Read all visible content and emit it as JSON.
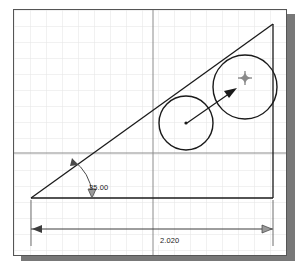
{
  "app": {
    "type": "cad-sketch-canvas",
    "background_color": "#ffffff",
    "border_color": "#555555",
    "shadow_color": "#787878"
  },
  "grid": {
    "minor_spacing_px": 16,
    "minor_color": "#e2e2e2",
    "major_color": "#8c8c8c",
    "major_vertical_x": 139,
    "major_horizontal_y": 143,
    "visible": true
  },
  "geometry": {
    "line_color": "#1a1a1a",
    "triangle": {
      "name": "right-triangle",
      "vertices": [
        [
          17,
          188
        ],
        [
          259,
          188
        ],
        [
          259,
          14
        ]
      ]
    },
    "circles": [
      {
        "name": "left-circle",
        "cx": 172,
        "cy": 113,
        "r": 27,
        "center_marker": true
      },
      {
        "name": "right-circle",
        "cx": 231,
        "cy": 77,
        "r": 32,
        "center_marker": false
      }
    ],
    "drag_arrow": {
      "from": [
        172,
        113
      ],
      "to": [
        222,
        79
      ]
    },
    "cursor": {
      "type": "crosshair-star",
      "x": 231,
      "y": 68
    }
  },
  "dimensions": {
    "angle": {
      "label": "35.00",
      "unit": "degrees",
      "leader_from": [
        59,
        152
      ],
      "leader_to": [
        78,
        188
      ]
    },
    "length": {
      "label": "2.020",
      "unit": "inches",
      "extent_from_x": 17,
      "extent_to_x": 259,
      "dim_line_y": 228
    }
  }
}
